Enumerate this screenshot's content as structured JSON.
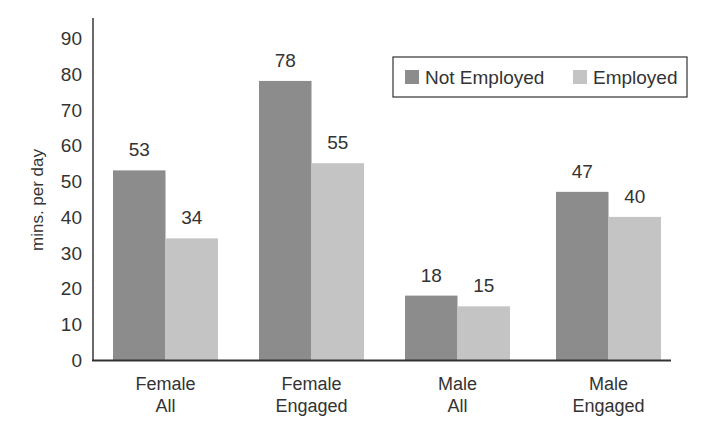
{
  "chart_data": {
    "type": "bar",
    "title": "",
    "xlabel": "",
    "ylabel": "mins. per day",
    "ylim": [
      0,
      90
    ],
    "yticks": [
      0,
      10,
      20,
      30,
      40,
      50,
      60,
      70,
      80,
      90
    ],
    "grid": false,
    "legend_position": "top-right",
    "categories": [
      [
        "Female",
        "All"
      ],
      [
        "Female",
        "Engaged"
      ],
      [
        "Male",
        "All"
      ],
      [
        "Male",
        "Engaged"
      ]
    ],
    "series": [
      {
        "name": "Not Employed",
        "color": "#8c8c8c",
        "values": [
          53,
          78,
          18,
          47
        ]
      },
      {
        "name": "Employed",
        "color": "#c4c4c4",
        "values": [
          34,
          55,
          15,
          40
        ]
      }
    ]
  }
}
